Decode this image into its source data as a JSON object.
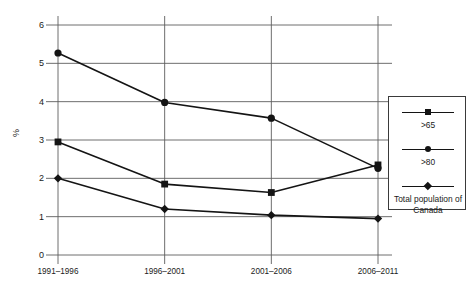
{
  "chart_data": {
    "type": "line",
    "title": "",
    "xlabel": "",
    "ylabel": "%",
    "categories": [
      "1991–1996",
      "1996–2001",
      "2001–2006",
      "2006–2011"
    ],
    "ylim": [
      0,
      6
    ],
    "yticks": [
      0,
      1,
      2,
      3,
      4,
      5,
      6
    ],
    "ytick_labels": [
      "0",
      "1",
      "2",
      "3",
      "4",
      "5",
      "6"
    ],
    "grid": true,
    "legend_position": "right",
    "series": [
      {
        "name": ">65",
        "marker": "square",
        "color": "#141414",
        "values": [
          2.95,
          1.85,
          1.63,
          2.35
        ]
      },
      {
        "name": ">80",
        "marker": "circle",
        "color": "#141414",
        "values": [
          5.27,
          3.98,
          3.57,
          2.26
        ]
      },
      {
        "name": "Total population of Canada",
        "marker": "diamond",
        "color": "#141414",
        "values": [
          2.0,
          1.2,
          1.04,
          0.95
        ]
      }
    ]
  },
  "legend": {
    "entries": [
      {
        "label": ">65",
        "marker": "square"
      },
      {
        "label": ">80",
        "marker": "circle"
      },
      {
        "label": "Total population of Canada",
        "marker": "diamond"
      }
    ]
  },
  "colors": {
    "series": "#141414",
    "gridline": "#5d5d5d",
    "text": "#1a1a1a",
    "background": "#ffffff"
  }
}
